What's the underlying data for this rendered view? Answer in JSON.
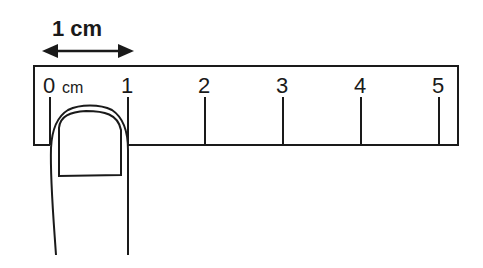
{
  "figure": {
    "title_label": "1 cm",
    "ruler": {
      "unit_label": "cm",
      "tick_labels": [
        "0",
        "1",
        "2",
        "3",
        "4",
        "5"
      ]
    },
    "annotation": "double-headed arrow spanning 0 to 1 cm"
  }
}
